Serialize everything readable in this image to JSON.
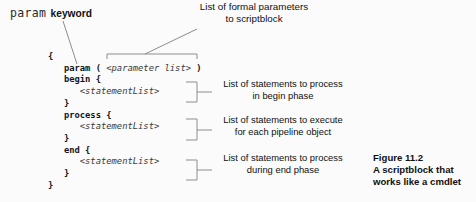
{
  "labels": {
    "param_keyword": {
      "mono": "param",
      "text": "keyword"
    },
    "formal_parameters": {
      "line1": "List of formal parameters",
      "line2": "to scriptblock"
    }
  },
  "code": {
    "lines": [
      [
        {
          "t": "{",
          "s": "b"
        }
      ],
      [
        {
          "t": "   param ( ",
          "s": "b"
        },
        {
          "t": "<parameter list>",
          "s": "i"
        },
        {
          "t": " )",
          "s": "b"
        }
      ],
      [
        {
          "t": "   begin {",
          "s": "b"
        }
      ],
      [
        {
          "t": "      <statementList>",
          "s": "i"
        }
      ],
      [
        {
          "t": "   }",
          "s": "b"
        }
      ],
      [
        {
          "t": "   process {",
          "s": "b"
        }
      ],
      [
        {
          "t": "      <statementList>",
          "s": "i"
        }
      ],
      [
        {
          "t": "   }",
          "s": "b"
        }
      ],
      [
        {
          "t": "   end {",
          "s": "b"
        }
      ],
      [
        {
          "t": "      <statementList>",
          "s": "i"
        }
      ],
      [
        {
          "t": "   }",
          "s": "b"
        }
      ],
      [
        {
          "t": "}",
          "s": "b"
        }
      ]
    ]
  },
  "annotations": [
    {
      "lines": [
        "List of statements to process",
        "in begin phase"
      ]
    },
    {
      "lines": [
        "List of statements to execute",
        "for each pipeline object"
      ]
    },
    {
      "lines": [
        "List of statements to process",
        "during end phase"
      ]
    }
  ],
  "figure_caption": {
    "line1": "Figure 11.2",
    "line2": "A scriptblock that",
    "line3": "works like a cmdlet"
  },
  "colors": {
    "connector_line": "#8d8d8d",
    "code_text": "#161616",
    "background": "#fbfbfb"
  }
}
